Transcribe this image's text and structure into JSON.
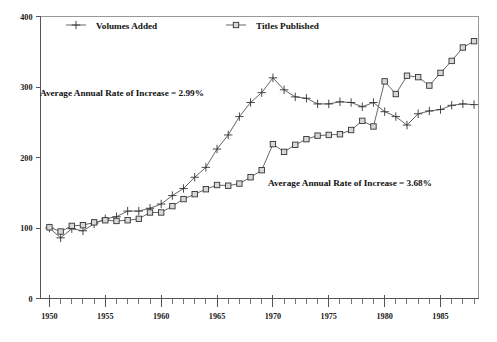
{
  "chart_data": {
    "type": "line",
    "title": "",
    "subtitle": "",
    "xlabel": "",
    "ylabel": "",
    "xlim": [
      1949.2,
      1988.4
    ],
    "ylim": [
      0,
      400
    ],
    "yticks": [
      0,
      100,
      200,
      300,
      400
    ],
    "ytick_labels": [
      "0",
      "100",
      "200",
      "300",
      "400"
    ],
    "xticks_major": [
      1950,
      1955,
      1960,
      1965,
      1970,
      1975,
      1980,
      1985
    ],
    "xtick_labels": [
      "1950",
      "1955",
      "1960",
      "1965",
      "1970",
      "1975",
      "1980",
      "1985"
    ],
    "xticks_minor": [
      1951,
      1952,
      1953,
      1954,
      1956,
      1957,
      1958,
      1959,
      1961,
      1962,
      1963,
      1964,
      1966,
      1967,
      1968,
      1969,
      1971,
      1972,
      1973,
      1974,
      1976,
      1977,
      1978,
      1979,
      1981,
      1982,
      1983,
      1984,
      1986,
      1987,
      1988
    ],
    "grid": false,
    "legend_position": "top",
    "x": [
      1950,
      1951,
      1952,
      1953,
      1954,
      1955,
      1956,
      1957,
      1958,
      1959,
      1960,
      1961,
      1962,
      1963,
      1964,
      1965,
      1966,
      1967,
      1968,
      1969,
      1970,
      1971,
      1972,
      1973,
      1974,
      1975,
      1976,
      1977,
      1978,
      1979,
      1980,
      1981,
      1982,
      1983,
      1984,
      1985,
      1986,
      1987,
      1988
    ],
    "series": [
      {
        "name": "Volumes Added",
        "marker": "cross",
        "values": [
          100,
          86,
          99,
          96,
          106,
          113,
          116,
          124,
          124,
          128,
          134,
          146,
          156,
          172,
          186,
          212,
          232,
          258,
          278,
          292,
          313,
          296,
          286,
          284,
          276,
          276,
          279,
          278,
          272,
          278,
          265,
          258,
          246,
          262,
          266,
          268,
          274,
          276,
          275
        ]
      },
      {
        "name": "Titles Published",
        "marker": "square",
        "values": [
          101,
          95,
          103,
          104,
          108,
          111,
          110,
          111,
          113,
          122,
          122,
          131,
          141,
          148,
          155,
          161,
          160,
          163,
          172,
          182,
          219,
          208,
          218,
          226,
          231,
          232,
          233,
          239,
          252,
          244,
          308,
          290,
          316,
          314,
          302,
          320,
          337,
          356,
          365
        ]
      }
    ],
    "annotations": [
      {
        "id": "rate-volumes",
        "text": "Average Annual Rate of Increase = 2.99%",
        "x_px": 40,
        "y_px": 96
      },
      {
        "id": "rate-titles",
        "text": "Average Annual Rate of Increase = 3.68%",
        "x_px": 268,
        "y_px": 186
      }
    ]
  },
  "legend": {
    "items": [
      {
        "label": "Volumes Added",
        "marker": "cross"
      },
      {
        "label": "Titles Published",
        "marker": "square"
      }
    ]
  }
}
